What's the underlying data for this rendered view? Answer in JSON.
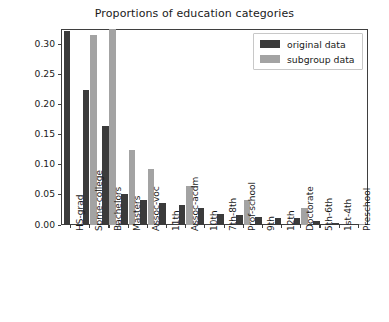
{
  "chart_data": {
    "type": "bar",
    "title": "Proportions of education categories",
    "xlabel": "",
    "ylabel": "Proportion",
    "ylim": [
      0.0,
      0.325
    ],
    "yticks": [
      0.0,
      0.05,
      0.1,
      0.15,
      0.2,
      0.25,
      0.3
    ],
    "ytick_labels": [
      "0.00",
      "0.05",
      "0.10",
      "0.15",
      "0.20",
      "0.25",
      "0.30"
    ],
    "grid": false,
    "legend_position": "upper right",
    "categories": [
      "HS-grad",
      "Some-college",
      "Bachelors",
      "Masters",
      "Assoc-voc",
      "11th",
      "Assoc-acdm",
      "10th",
      "7th-8th",
      "Prof-school",
      "9th",
      "12th",
      "Doctorate",
      "5th-6th",
      "1st-4th",
      "Preschool"
    ],
    "series": [
      {
        "name": "original data",
        "color": "#3b3b3b",
        "values": [
          0.322,
          0.224,
          0.164,
          0.051,
          0.042,
          0.036,
          0.033,
          0.028,
          0.018,
          0.017,
          0.014,
          0.011,
          0.011,
          0.007,
          0.003,
          0.001
        ]
      },
      {
        "name": "subgroup data",
        "color": "#a3a3a3",
        "values": [
          0.0,
          0.315,
          0.325,
          0.124,
          0.093,
          0.0,
          0.065,
          0.0,
          0.0,
          0.041,
          0.0,
          0.0,
          0.029,
          0.0,
          0.0,
          0.001
        ]
      }
    ]
  },
  "legend": {
    "items": [
      {
        "label": "original data",
        "swatch": "orig"
      },
      {
        "label": "subgroup data",
        "swatch": "sub"
      }
    ]
  }
}
